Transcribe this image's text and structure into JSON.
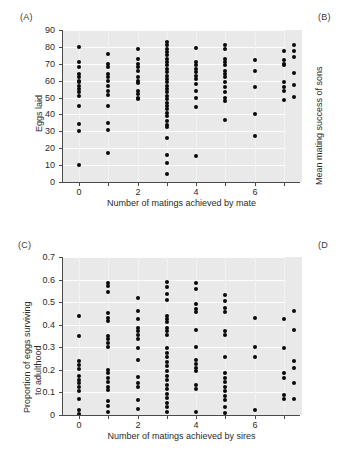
{
  "figure": {
    "background_color": "#ffffff",
    "plot_background_color": "#e9e9e9",
    "gridline_color": "#fdfdfd",
    "point_color": "#0a0a0a"
  },
  "panels": {
    "a": {
      "label": "(A)",
      "xlabel": "Number of matings achieved by mate",
      "ylabel": "Eggs laid"
    },
    "b": {
      "label": "(B)",
      "ylabel": "Mean mating success of sons"
    },
    "c": {
      "label": "(C)",
      "xlabel": "Number of matings achieved by sires",
      "ylabel_line1": "Proportion of eggs surviving",
      "ylabel_line2": "to adulthood"
    },
    "d": {
      "label": "(D"
    }
  },
  "chart_data": [
    {
      "id": "panel-a",
      "type": "scatter",
      "title": "(A)",
      "xlabel": "Number of matings achieved by mate",
      "ylabel": "Eggs laid",
      "xlim": [
        -0.55,
        7.55
      ],
      "ylim": [
        0,
        90
      ],
      "xticks": [
        0,
        2,
        4,
        6
      ],
      "xticks_minor": [
        1,
        3,
        5,
        7
      ],
      "yticks": [
        0,
        10,
        20,
        30,
        40,
        50,
        60,
        70,
        80,
        90
      ],
      "xtick_labels": [
        "0",
        "2",
        "4",
        "6"
      ],
      "ytick_labels": [
        "0",
        "10",
        "20",
        "30",
        "40",
        "50",
        "60",
        "70",
        "80",
        "90"
      ],
      "grid": "horizontal-white",
      "legend": "none",
      "points": [
        {
          "x": 0,
          "y": 80
        },
        {
          "x": 0,
          "y": 71
        },
        {
          "x": 0,
          "y": 68
        },
        {
          "x": 0,
          "y": 64
        },
        {
          "x": 0,
          "y": 62
        },
        {
          "x": 0,
          "y": 60
        },
        {
          "x": 0,
          "y": 59
        },
        {
          "x": 0,
          "y": 57
        },
        {
          "x": 0,
          "y": 55
        },
        {
          "x": 0,
          "y": 53
        },
        {
          "x": 0,
          "y": 51
        },
        {
          "x": 0,
          "y": 45
        },
        {
          "x": 0,
          "y": 34.5
        },
        {
          "x": 0,
          "y": 30
        },
        {
          "x": 0,
          "y": 10
        },
        {
          "x": 1,
          "y": 75.5
        },
        {
          "x": 1,
          "y": 70
        },
        {
          "x": 1,
          "y": 68
        },
        {
          "x": 1,
          "y": 64
        },
        {
          "x": 1,
          "y": 62
        },
        {
          "x": 1,
          "y": 60
        },
        {
          "x": 1,
          "y": 57
        },
        {
          "x": 1,
          "y": 54
        },
        {
          "x": 1,
          "y": 51.5
        },
        {
          "x": 1,
          "y": 45
        },
        {
          "x": 1,
          "y": 35
        },
        {
          "x": 1,
          "y": 31
        },
        {
          "x": 1,
          "y": 17
        },
        {
          "x": 2,
          "y": 79
        },
        {
          "x": 2,
          "y": 73
        },
        {
          "x": 2,
          "y": 70
        },
        {
          "x": 2,
          "y": 68
        },
        {
          "x": 2,
          "y": 66
        },
        {
          "x": 2,
          "y": 62
        },
        {
          "x": 2,
          "y": 60
        },
        {
          "x": 2,
          "y": 58.5
        },
        {
          "x": 2,
          "y": 54
        },
        {
          "x": 2,
          "y": 52
        },
        {
          "x": 2,
          "y": 50
        },
        {
          "x": 2,
          "y": 49
        },
        {
          "x": 3,
          "y": 83
        },
        {
          "x": 3,
          "y": 81
        },
        {
          "x": 3,
          "y": 79
        },
        {
          "x": 3,
          "y": 77
        },
        {
          "x": 3,
          "y": 75
        },
        {
          "x": 3,
          "y": 73
        },
        {
          "x": 3,
          "y": 71
        },
        {
          "x": 3,
          "y": 69
        },
        {
          "x": 3,
          "y": 67
        },
        {
          "x": 3,
          "y": 65
        },
        {
          "x": 3,
          "y": 63
        },
        {
          "x": 3,
          "y": 61
        },
        {
          "x": 3,
          "y": 59
        },
        {
          "x": 3,
          "y": 57
        },
        {
          "x": 3,
          "y": 55
        },
        {
          "x": 3,
          "y": 53
        },
        {
          "x": 3,
          "y": 51
        },
        {
          "x": 3,
          "y": 49
        },
        {
          "x": 3,
          "y": 47
        },
        {
          "x": 3,
          "y": 45
        },
        {
          "x": 3,
          "y": 43
        },
        {
          "x": 3,
          "y": 41
        },
        {
          "x": 3,
          "y": 39
        },
        {
          "x": 3,
          "y": 36
        },
        {
          "x": 3,
          "y": 34
        },
        {
          "x": 3,
          "y": 32.5
        },
        {
          "x": 3,
          "y": 26
        },
        {
          "x": 3,
          "y": 16
        },
        {
          "x": 3,
          "y": 11.5
        },
        {
          "x": 3,
          "y": 5
        },
        {
          "x": 4,
          "y": 79.5
        },
        {
          "x": 4,
          "y": 71
        },
        {
          "x": 4,
          "y": 69
        },
        {
          "x": 4,
          "y": 67
        },
        {
          "x": 4,
          "y": 65
        },
        {
          "x": 4,
          "y": 63
        },
        {
          "x": 4,
          "y": 61
        },
        {
          "x": 4,
          "y": 58
        },
        {
          "x": 4,
          "y": 54
        },
        {
          "x": 4,
          "y": 50
        },
        {
          "x": 4,
          "y": 44.5
        },
        {
          "x": 4,
          "y": 15.5
        },
        {
          "x": 5,
          "y": 81
        },
        {
          "x": 5,
          "y": 79
        },
        {
          "x": 5,
          "y": 73
        },
        {
          "x": 5,
          "y": 71
        },
        {
          "x": 5,
          "y": 69
        },
        {
          "x": 5,
          "y": 66
        },
        {
          "x": 5,
          "y": 64
        },
        {
          "x": 5,
          "y": 62
        },
        {
          "x": 5,
          "y": 59
        },
        {
          "x": 5,
          "y": 56
        },
        {
          "x": 5,
          "y": 53
        },
        {
          "x": 5,
          "y": 50
        },
        {
          "x": 5,
          "y": 48
        },
        {
          "x": 5,
          "y": 36.5
        },
        {
          "x": 6,
          "y": 72
        },
        {
          "x": 6,
          "y": 66
        },
        {
          "x": 6,
          "y": 56
        },
        {
          "x": 6,
          "y": 40.5
        },
        {
          "x": 6,
          "y": 27
        },
        {
          "x": 7,
          "y": 77.5
        },
        {
          "x": 7,
          "y": 72
        },
        {
          "x": 7,
          "y": 70
        },
        {
          "x": 7,
          "y": 69
        },
        {
          "x": 7,
          "y": 59
        },
        {
          "x": 7,
          "y": 56
        },
        {
          "x": 7,
          "y": 54
        },
        {
          "x": 7,
          "y": 48.5
        }
      ]
    },
    {
      "id": "panel-c",
      "type": "scatter",
      "title": "(C)",
      "xlabel": "Number of matings achieved by sires",
      "ylabel": "Proportion of eggs surviving to adulthood",
      "xlim": [
        -0.55,
        7.55
      ],
      "ylim": [
        0,
        0.7
      ],
      "xticks": [
        0,
        2,
        4,
        6
      ],
      "xticks_minor": [
        1,
        3,
        5,
        7
      ],
      "yticks": [
        0,
        0.1,
        0.2,
        0.3,
        0.4,
        0.5,
        0.6,
        0.7
      ],
      "xtick_labels": [
        "0",
        "2",
        "4",
        "6"
      ],
      "ytick_labels": [
        "0",
        "0.1",
        "0.2",
        "0.3",
        "0.4",
        "0.5",
        "0.6",
        "0.7"
      ],
      "grid": "horizontal-white",
      "legend": "none",
      "points": [
        {
          "x": 0,
          "y": 0.44
        },
        {
          "x": 0,
          "y": 0.35
        },
        {
          "x": 0,
          "y": 0.24
        },
        {
          "x": 0,
          "y": 0.22
        },
        {
          "x": 0,
          "y": 0.205
        },
        {
          "x": 0,
          "y": 0.175
        },
        {
          "x": 0,
          "y": 0.155
        },
        {
          "x": 0,
          "y": 0.14
        },
        {
          "x": 0,
          "y": 0.125
        },
        {
          "x": 0,
          "y": 0.105
        },
        {
          "x": 0,
          "y": 0.07
        },
        {
          "x": 0,
          "y": 0.02
        },
        {
          "x": 0,
          "y": 0.005
        },
        {
          "x": 1,
          "y": 0.585
        },
        {
          "x": 1,
          "y": 0.57
        },
        {
          "x": 1,
          "y": 0.545
        },
        {
          "x": 1,
          "y": 0.45
        },
        {
          "x": 1,
          "y": 0.43
        },
        {
          "x": 1,
          "y": 0.415
        },
        {
          "x": 1,
          "y": 0.35
        },
        {
          "x": 1,
          "y": 0.335
        },
        {
          "x": 1,
          "y": 0.32
        },
        {
          "x": 1,
          "y": 0.3
        },
        {
          "x": 1,
          "y": 0.2
        },
        {
          "x": 1,
          "y": 0.185
        },
        {
          "x": 1,
          "y": 0.165
        },
        {
          "x": 1,
          "y": 0.145
        },
        {
          "x": 1,
          "y": 0.125
        },
        {
          "x": 1,
          "y": 0.11
        },
        {
          "x": 1,
          "y": 0.06
        },
        {
          "x": 1,
          "y": 0.04
        },
        {
          "x": 1,
          "y": 0.015
        },
        {
          "x": 2,
          "y": 0.52
        },
        {
          "x": 2,
          "y": 0.46
        },
        {
          "x": 2,
          "y": 0.425
        },
        {
          "x": 2,
          "y": 0.385
        },
        {
          "x": 2,
          "y": 0.37
        },
        {
          "x": 2,
          "y": 0.355
        },
        {
          "x": 2,
          "y": 0.335
        },
        {
          "x": 2,
          "y": 0.295
        },
        {
          "x": 2,
          "y": 0.245
        },
        {
          "x": 2,
          "y": 0.17
        },
        {
          "x": 2,
          "y": 0.14
        },
        {
          "x": 2,
          "y": 0.125
        },
        {
          "x": 2,
          "y": 0.065
        },
        {
          "x": 2,
          "y": 0.025
        },
        {
          "x": 3,
          "y": 0.59
        },
        {
          "x": 3,
          "y": 0.565
        },
        {
          "x": 3,
          "y": 0.535
        },
        {
          "x": 3,
          "y": 0.51
        },
        {
          "x": 3,
          "y": 0.44
        },
        {
          "x": 3,
          "y": 0.425
        },
        {
          "x": 3,
          "y": 0.41
        },
        {
          "x": 3,
          "y": 0.385
        },
        {
          "x": 3,
          "y": 0.37
        },
        {
          "x": 3,
          "y": 0.355
        },
        {
          "x": 3,
          "y": 0.295
        },
        {
          "x": 3,
          "y": 0.275
        },
        {
          "x": 3,
          "y": 0.255
        },
        {
          "x": 3,
          "y": 0.235
        },
        {
          "x": 3,
          "y": 0.215
        },
        {
          "x": 3,
          "y": 0.195
        },
        {
          "x": 3,
          "y": 0.175
        },
        {
          "x": 3,
          "y": 0.155
        },
        {
          "x": 3,
          "y": 0.135
        },
        {
          "x": 3,
          "y": 0.115
        },
        {
          "x": 3,
          "y": 0.095
        },
        {
          "x": 3,
          "y": 0.075
        },
        {
          "x": 3,
          "y": 0.055
        },
        {
          "x": 3,
          "y": 0.035
        },
        {
          "x": 3,
          "y": 0.015
        },
        {
          "x": 4,
          "y": 0.585
        },
        {
          "x": 4,
          "y": 0.56
        },
        {
          "x": 4,
          "y": 0.49
        },
        {
          "x": 4,
          "y": 0.47
        },
        {
          "x": 4,
          "y": 0.455
        },
        {
          "x": 4,
          "y": 0.375
        },
        {
          "x": 4,
          "y": 0.3
        },
        {
          "x": 4,
          "y": 0.245
        },
        {
          "x": 4,
          "y": 0.225
        },
        {
          "x": 4,
          "y": 0.21
        },
        {
          "x": 4,
          "y": 0.195
        },
        {
          "x": 4,
          "y": 0.135
        },
        {
          "x": 4,
          "y": 0.115
        },
        {
          "x": 4,
          "y": 0.015
        },
        {
          "x": 5,
          "y": 0.53
        },
        {
          "x": 5,
          "y": 0.505
        },
        {
          "x": 5,
          "y": 0.475
        },
        {
          "x": 5,
          "y": 0.455
        },
        {
          "x": 5,
          "y": 0.37
        },
        {
          "x": 5,
          "y": 0.355
        },
        {
          "x": 5,
          "y": 0.255
        },
        {
          "x": 5,
          "y": 0.185
        },
        {
          "x": 5,
          "y": 0.165
        },
        {
          "x": 5,
          "y": 0.145
        },
        {
          "x": 5,
          "y": 0.125
        },
        {
          "x": 5,
          "y": 0.105
        },
        {
          "x": 5,
          "y": 0.085
        },
        {
          "x": 5,
          "y": 0.065
        },
        {
          "x": 5,
          "y": 0.035
        },
        {
          "x": 5,
          "y": 0.01
        },
        {
          "x": 6,
          "y": 0.43
        },
        {
          "x": 6,
          "y": 0.3
        },
        {
          "x": 6,
          "y": 0.255
        },
        {
          "x": 6,
          "y": 0.02
        },
        {
          "x": 7,
          "y": 0.425
        },
        {
          "x": 7,
          "y": 0.295
        },
        {
          "x": 7,
          "y": 0.185
        },
        {
          "x": 7,
          "y": 0.165
        },
        {
          "x": 7,
          "y": 0.09
        },
        {
          "x": 7,
          "y": 0.07
        }
      ]
    }
  ]
}
